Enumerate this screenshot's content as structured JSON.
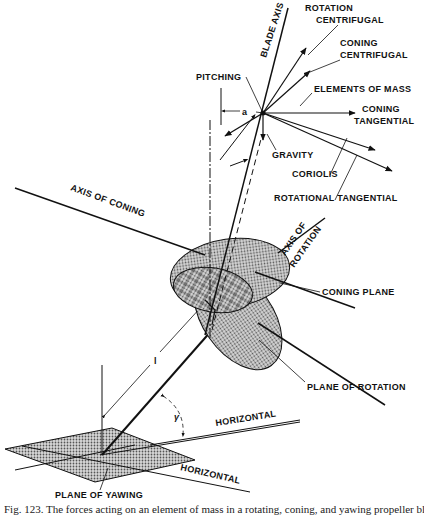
{
  "figure": {
    "labels": {
      "blade_axis": "BLADE AXIS",
      "rotation_centrifugal_1": "ROTATION",
      "rotation_centrifugal_2": "CENTRIFUGAL",
      "coning_centrifugal_1": "CONING",
      "coning_centrifugal_2": "CENTRIFUGAL",
      "pitching": "PITCHING",
      "elements_of_mass": "ELEMENTS OF MASS",
      "coning_tangential_1": "CONING",
      "coning_tangential_2": "TANGENTIAL",
      "gravity": "GRAVITY",
      "coriolis": "CORIOLIS",
      "rotational_tangential": "ROTATIONAL TANGENTIAL",
      "axis_of_coning": "AXIS OF CONING",
      "axis_of_rotation_1": "AXIS OF",
      "axis_of_rotation_2": "ROTATION",
      "coning_plane": "CONING PLANE",
      "plane_of_rotation": "PLANE OF ROTATION",
      "horizontal_upper": "HORIZONTAL",
      "horizontal_lower": "HORIZONTAL",
      "plane_of_yawing": "PLANE OF YAWING",
      "symbol_a": "a",
      "symbol_l": "l",
      "symbol_gamma": "γ"
    },
    "colors": {
      "ink": "#111111",
      "shade": "#b8b8b8",
      "background": "#ffffff"
    }
  },
  "caption": {
    "text": "Fig. 123. The forces acting on an element of mass in a rotating, coning, and yawing propeller blade"
  }
}
